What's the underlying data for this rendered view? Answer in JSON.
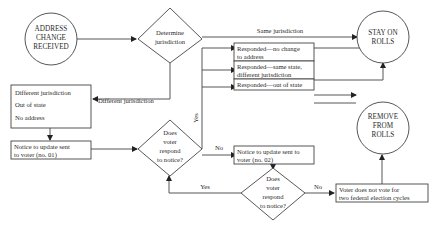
{
  "diagram": {
    "type": "flowchart",
    "nodes": {
      "start": {
        "shape": "circle",
        "lines": [
          "ADDRESS",
          "CHANGE",
          "RECEIVED"
        ]
      },
      "determine": {
        "shape": "diamond",
        "lines": [
          "Determine",
          "jurisdiction"
        ]
      },
      "stay": {
        "shape": "circle",
        "lines": [
          "STAY ON",
          "ROLLS"
        ]
      },
      "reasons": {
        "shape": "box",
        "lines": [
          "Different jurisdiction",
          "Out of state",
          "No address"
        ]
      },
      "notice1": {
        "shape": "box",
        "lines": [
          "Notice to update sent",
          "to voter (no. 01)"
        ]
      },
      "respond1": {
        "shape": "diamond",
        "lines": [
          "Does",
          "voter",
          "respond",
          "to notice?"
        ]
      },
      "resp_nochange": {
        "shape": "box",
        "lines": [
          "Responded—no change",
          "to address"
        ]
      },
      "resp_samestate": {
        "shape": "box",
        "lines": [
          "Responded—same state,",
          "different jurisdiction"
        ]
      },
      "resp_outofstate": {
        "shape": "box",
        "lines": [
          "Responded—out of state"
        ]
      },
      "notice2": {
        "shape": "box",
        "lines": [
          "Notice to update sent to",
          "voter (no. 02)"
        ]
      },
      "respond2": {
        "shape": "diamond",
        "lines": [
          "Does",
          "voter",
          "respond",
          "to notice?"
        ]
      },
      "remove": {
        "shape": "circle",
        "lines": [
          "REMOVE",
          "FROM",
          "ROLLS"
        ]
      },
      "novote": {
        "shape": "box",
        "lines": [
          "Voter does not vote for",
          "two federal election cycles"
        ]
      }
    },
    "edge_labels": {
      "same_jurisdiction": "Same jurisdiction",
      "different_jurisdiction": "Different jurisdiction",
      "yes1": "Yes",
      "no1": "No",
      "yes2": "Yes",
      "no2": "No"
    }
  }
}
